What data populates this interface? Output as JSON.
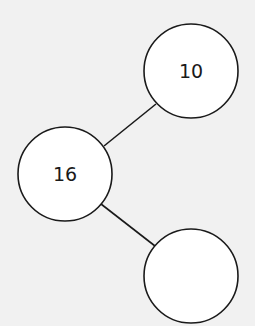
{
  "diagram": {
    "type": "number-bond",
    "nodes": [
      {
        "id": "whole",
        "label": "16",
        "cx": 65,
        "cy": 174,
        "r": 47
      },
      {
        "id": "part-top",
        "label": "10",
        "cx": 191,
        "cy": 71,
        "r": 47
      },
      {
        "id": "part-bottom",
        "label": "",
        "cx": 191,
        "cy": 276,
        "r": 47
      }
    ],
    "edges": [
      {
        "from": "whole",
        "to": "part-top"
      },
      {
        "from": "whole",
        "to": "part-bottom"
      }
    ],
    "colors": {
      "background": "#f1f1f1",
      "stroke": "#1a1a1a",
      "fill": "#ffffff"
    }
  }
}
